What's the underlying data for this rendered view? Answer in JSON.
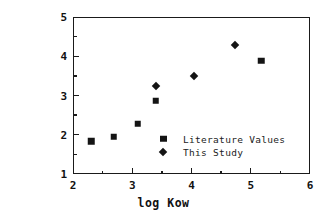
{
  "chart_data": {
    "type": "scatter",
    "title": "",
    "xlabel": "log  Kow",
    "ylabel": "log Koc",
    "xlim": [
      2,
      6
    ],
    "ylim": [
      1,
      5
    ],
    "xticks": [
      2,
      3,
      4,
      5,
      6
    ],
    "yticks": [
      1,
      2,
      3,
      4,
      5
    ],
    "xtick_labels": [
      "2",
      "3",
      "4",
      "5",
      "6"
    ],
    "ytick_labels": [
      "1",
      "2",
      "3",
      "4",
      "5"
    ],
    "xminor_ticks": [
      2.5,
      3.5,
      4.5,
      5.5
    ],
    "yminor_ticks": [
      1.5,
      2.5,
      3.5,
      4.5
    ],
    "grid": false,
    "legend_position": "center",
    "series": [
      {
        "name": "Literature Values",
        "marker": "square",
        "color": "#141414",
        "points": [
          {
            "x": 2.31,
            "y": 1.84
          },
          {
            "x": 2.69,
            "y": 1.95
          },
          {
            "x": 3.09,
            "y": 2.28
          },
          {
            "x": 3.4,
            "y": 2.86
          },
          {
            "x": 5.18,
            "y": 3.88
          }
        ]
      },
      {
        "name": "This Study",
        "marker": "diamond",
        "color": "#141414",
        "points": [
          {
            "x": 3.4,
            "y": 3.23
          },
          {
            "x": 4.05,
            "y": 3.5
          },
          {
            "x": 4.74,
            "y": 4.29
          }
        ]
      }
    ]
  },
  "axes": {
    "xlabel": "log  Kow",
    "ylabel": "log Koc"
  },
  "legend": {
    "entries": [
      {
        "label": "Literature Values",
        "marker": "square"
      },
      {
        "label": "This Study",
        "marker": "diamond"
      }
    ]
  }
}
